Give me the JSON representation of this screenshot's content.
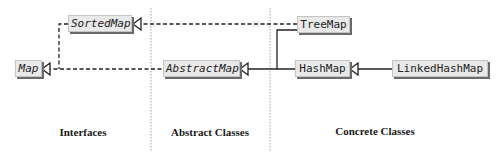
{
  "diagram": {
    "columns": [
      {
        "id": "interfaces",
        "label": "Interfaces"
      },
      {
        "id": "abstract",
        "label": "Abstract Classes"
      },
      {
        "id": "concrete",
        "label": "Concrete Classes"
      }
    ],
    "nodes": {
      "map": {
        "label": "Map",
        "kind": "interface"
      },
      "sorted_map": {
        "label": "SortedMap",
        "kind": "interface"
      },
      "abstract_map": {
        "label": "AbstractMap",
        "kind": "abstract-class"
      },
      "tree_map": {
        "label": "TreeMap",
        "kind": "concrete-class"
      },
      "hash_map": {
        "label": "HashMap",
        "kind": "concrete-class"
      },
      "linked_hash_map": {
        "label": "LinkedHashMap",
        "kind": "concrete-class"
      }
    },
    "edges": [
      {
        "from": "SortedMap",
        "to": "Map",
        "style": "dashed",
        "relation": "extends-interface"
      },
      {
        "from": "AbstractMap",
        "to": "Map",
        "style": "dashed",
        "relation": "implements"
      },
      {
        "from": "TreeMap",
        "to": "SortedMap",
        "style": "dashed",
        "relation": "implements"
      },
      {
        "from": "TreeMap",
        "to": "AbstractMap",
        "style": "solid",
        "relation": "extends"
      },
      {
        "from": "HashMap",
        "to": "AbstractMap",
        "style": "solid",
        "relation": "extends"
      },
      {
        "from": "LinkedHashMap",
        "to": "HashMap",
        "style": "solid",
        "relation": "extends"
      }
    ],
    "colors": {
      "box_fill": "#e9e9e9",
      "box_shadow": "#6a6a6a",
      "line": "#222222",
      "separator": "#8a8a8a"
    }
  }
}
